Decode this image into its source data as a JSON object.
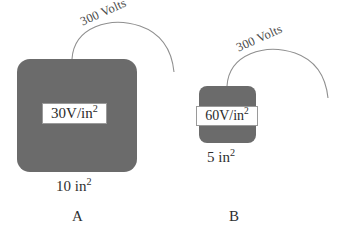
{
  "figure": {
    "background_color": "#ffffff",
    "block_color": "#6b6b6b",
    "arc_color": "#8a8a8a"
  },
  "items": [
    {
      "caption": "A",
      "voltage_label": "300 Volts",
      "value_number": "30V/in",
      "value_exponent": "2",
      "dimension_number": "10 in",
      "dimension_exponent": "2"
    },
    {
      "caption": "B",
      "voltage_label": "300 Volts",
      "value_number": "60V/in",
      "value_exponent": "2",
      "dimension_number": "5 in",
      "dimension_exponent": "2"
    }
  ]
}
